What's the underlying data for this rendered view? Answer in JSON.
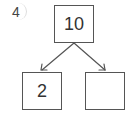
{
  "problem": {
    "number": "4"
  },
  "number_bond": {
    "whole": "10",
    "part_left": "2",
    "part_right": ""
  }
}
